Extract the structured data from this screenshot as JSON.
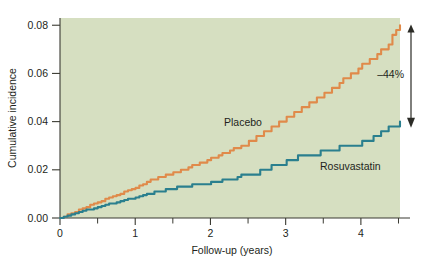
{
  "chart_data": {
    "type": "line",
    "title": "",
    "subtitle": "",
    "xlabel": "Follow-up (years)",
    "ylabel": "Cumulative incidence",
    "xlim": [
      0,
      4.52
    ],
    "ylim": [
      0,
      0.083
    ],
    "xticks": [
      0,
      1,
      2,
      3,
      4
    ],
    "xtick_labels": [
      "0",
      "1",
      "2",
      "3",
      "4"
    ],
    "xminor_ticks": [
      0.5,
      1.5,
      2.5,
      3.5,
      4.5
    ],
    "yticks": [
      0.0,
      0.02,
      0.04,
      0.06,
      0.08
    ],
    "ytick_labels": [
      "0.00",
      "0.02",
      "0.04",
      "0.06",
      "0.08"
    ],
    "grid": false,
    "legend_position": "inline-labels",
    "plot_background_color": "#d6dfc1",
    "figure_background_color": "#ffffff",
    "series": [
      {
        "name": "Placebo",
        "color": "#e08a4a",
        "label_text": "Placebo",
        "final_value": 0.0795,
        "x": [
          0,
          0.1,
          0.2,
          0.3,
          0.4,
          0.5,
          0.6,
          0.7,
          0.8,
          0.9,
          1.0,
          1.1,
          1.2,
          1.3,
          1.4,
          1.5,
          1.6,
          1.7,
          1.8,
          1.9,
          2.0,
          2.1,
          2.2,
          2.3,
          2.4,
          2.5,
          2.6,
          2.7,
          2.8,
          2.9,
          3.0,
          3.1,
          3.2,
          3.3,
          3.4,
          3.5,
          3.6,
          3.7,
          3.8,
          3.9,
          4.0,
          4.1,
          4.2,
          4.3,
          4.4,
          4.5
        ],
        "values": [
          0.0,
          0.0013,
          0.0026,
          0.004,
          0.0053,
          0.0066,
          0.0078,
          0.009,
          0.0102,
          0.0114,
          0.0126,
          0.014,
          0.0155,
          0.0168,
          0.0178,
          0.0188,
          0.0198,
          0.0209,
          0.022,
          0.0232,
          0.0244,
          0.0258,
          0.0272,
          0.0286,
          0.03,
          0.0314,
          0.033,
          0.0348,
          0.0368,
          0.039,
          0.0412,
          0.0432,
          0.0452,
          0.0472,
          0.0492,
          0.0512,
          0.0532,
          0.0556,
          0.058,
          0.0604,
          0.0628,
          0.0652,
          0.0676,
          0.0702,
          0.074,
          0.0795
        ]
      },
      {
        "name": "Rosuvastatin",
        "color": "#2a7f8e",
        "label_text": "Rosuvastatin",
        "final_value": 0.0395,
        "x": [
          0,
          0.1,
          0.2,
          0.3,
          0.4,
          0.5,
          0.6,
          0.7,
          0.8,
          0.9,
          1.0,
          1.1,
          1.2,
          1.3,
          1.4,
          1.5,
          1.6,
          1.7,
          1.8,
          1.9,
          2.0,
          2.1,
          2.2,
          2.3,
          2.4,
          2.5,
          2.6,
          2.7,
          2.8,
          2.9,
          3.0,
          3.1,
          3.2,
          3.3,
          3.4,
          3.5,
          3.6,
          3.7,
          3.8,
          3.9,
          4.0,
          4.1,
          4.2,
          4.3,
          4.4,
          4.5
        ],
        "values": [
          0.0,
          0.0009,
          0.0019,
          0.0028,
          0.0037,
          0.0046,
          0.0054,
          0.0062,
          0.007,
          0.0078,
          0.0086,
          0.0094,
          0.0102,
          0.011,
          0.0118,
          0.0124,
          0.013,
          0.0134,
          0.0138,
          0.0142,
          0.0146,
          0.0152,
          0.0158,
          0.0164,
          0.017,
          0.0178,
          0.0188,
          0.02,
          0.0212,
          0.0222,
          0.0232,
          0.0244,
          0.0254,
          0.0262,
          0.0268,
          0.0276,
          0.0284,
          0.029,
          0.0296,
          0.0302,
          0.0308,
          0.0322,
          0.0344,
          0.0362,
          0.0378,
          0.0395
        ]
      }
    ],
    "annotations": [
      {
        "name": "risk-reduction",
        "text": "–44%",
        "arrow": "vertical-double-ended",
        "from_value": 0.0795,
        "to_value": 0.0395,
        "at_x": 4.55
      }
    ]
  }
}
